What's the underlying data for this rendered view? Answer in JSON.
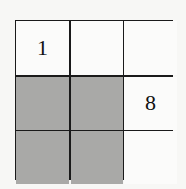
{
  "grid": {
    "rows": 3,
    "cols": 3,
    "cells": [
      [
        {
          "value": "1",
          "shaded": false
        },
        {
          "value": "",
          "shaded": false
        },
        {
          "value": "",
          "shaded": false
        }
      ],
      [
        {
          "value": "",
          "shaded": true
        },
        {
          "value": "",
          "shaded": true
        },
        {
          "value": "8",
          "shaded": false
        }
      ],
      [
        {
          "value": "",
          "shaded": true
        },
        {
          "value": "",
          "shaded": true
        },
        {
          "value": "",
          "shaded": false
        }
      ]
    ],
    "colors": {
      "shaded": "#a9a9a7",
      "blank": "#fbfbfa",
      "line": "#1a1a1a"
    }
  }
}
